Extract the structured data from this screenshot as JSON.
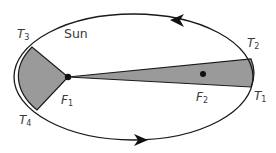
{
  "diagram": {
    "colors": {
      "orbit_stroke": "#1a1a1a",
      "shaded_area": "#9a9a9a",
      "text": "#3a3a3a"
    },
    "ellipse": {
      "cx": 133.5,
      "cy": 77,
      "rx": 119.5,
      "ry": 63
    },
    "labels": {
      "sun": "Sun",
      "t1": {
        "letter": "T",
        "sub": "1"
      },
      "t2": {
        "letter": "T",
        "sub": "2"
      },
      "t3": {
        "letter": "T",
        "sub": "3"
      },
      "t4": {
        "letter": "T",
        "sub": "4"
      },
      "f1": {
        "letter": "F",
        "sub": "1"
      },
      "f2": {
        "letter": "F",
        "sub": "2"
      }
    },
    "points": {
      "F1": [
        68,
        77
      ],
      "F2": [
        203,
        74
      ],
      "T1": [
        251,
        87
      ],
      "T2": [
        251,
        59
      ],
      "T3": [
        32,
        47
      ],
      "T4": [
        37,
        110
      ]
    },
    "arrows": [
      {
        "position": "top",
        "direction": "left",
        "at": [
          180,
          20
        ]
      },
      {
        "position": "bottom",
        "direction": "right",
        "at": [
          138,
          139
        ]
      }
    ]
  }
}
